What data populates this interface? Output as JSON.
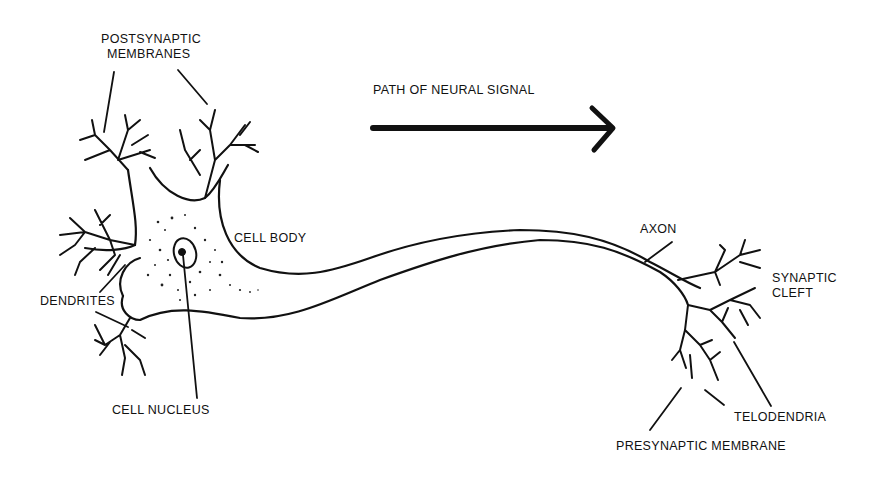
{
  "title": "PATH OF NEURAL SIGNAL",
  "labels": {
    "postsynaptic_1": "POSTSYNAPTIC",
    "postsynaptic_2": "MEMBRANES",
    "cell_body": "CELL BODY",
    "dendrites": "DENDRITES",
    "cell_nucleus": "CELL NUCLEUS",
    "axon": "AXON",
    "synaptic_1": "SYNAPTIC",
    "synaptic_2": "CLEFT",
    "telodendria": "TELODENDRIA",
    "presynaptic": "PRESYNAPTIC MEMBRANE"
  },
  "colors": {
    "ink": "#111111",
    "background": "#ffffff"
  }
}
